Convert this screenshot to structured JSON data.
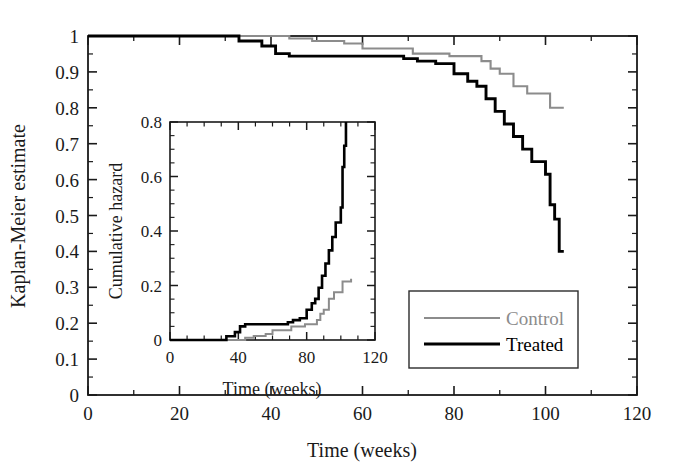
{
  "figure": {
    "background": "#ffffff",
    "colors": {
      "control": "#8c8c8c",
      "treated": "#000000",
      "axis": "#1a1a1a"
    }
  },
  "chart_data": {
    "type": "line",
    "title": "",
    "xlabel": "Time (weeks)",
    "ylabel": "Kaplan-Meier estimate",
    "xlim": [
      0,
      120
    ],
    "ylim": [
      0,
      1
    ],
    "xticks": [
      0,
      20,
      40,
      60,
      80,
      100,
      120
    ],
    "xticklabels": [
      "0",
      "20",
      "40",
      "60",
      "80",
      "100",
      "120"
    ],
    "yticks": [
      0,
      0.1,
      0.2,
      0.3,
      0.4,
      0.5,
      0.6,
      0.7,
      0.8,
      0.9,
      1
    ],
    "yticklabels": [
      "0",
      "0.1",
      "0.2",
      "0.3",
      "0.4",
      "0.5",
      "0.6",
      "0.7",
      "0.8",
      "0.9",
      "1"
    ],
    "xminor_step": 10,
    "yminor_step": 0.05,
    "grid": false,
    "legend_position": "lower right",
    "step_style": "post",
    "series": [
      {
        "name": "Control",
        "color": "#8c8c8c",
        "points": [
          [
            0,
            1.0
          ],
          [
            44,
            1.0
          ],
          [
            44,
            0.993
          ],
          [
            49,
            0.993
          ],
          [
            49,
            0.986
          ],
          [
            56,
            0.986
          ],
          [
            56,
            0.979
          ],
          [
            60,
            0.979
          ],
          [
            60,
            0.965
          ],
          [
            71,
            0.965
          ],
          [
            71,
            0.951
          ],
          [
            79,
            0.951
          ],
          [
            79,
            0.944
          ],
          [
            86,
            0.944
          ],
          [
            86,
            0.93
          ],
          [
            88,
            0.93
          ],
          [
            88,
            0.909
          ],
          [
            90,
            0.909
          ],
          [
            90,
            0.895
          ],
          [
            93,
            0.895
          ],
          [
            93,
            0.86
          ],
          [
            96,
            0.86
          ],
          [
            96,
            0.84
          ],
          [
            101,
            0.84
          ],
          [
            101,
            0.8
          ],
          [
            104,
            0.8
          ]
        ]
      },
      {
        "name": "Treated",
        "color": "#000000",
        "points": [
          [
            0,
            1.0
          ],
          [
            33,
            1.0
          ],
          [
            33,
            0.986
          ],
          [
            38,
            0.986
          ],
          [
            38,
            0.972
          ],
          [
            41,
            0.972
          ],
          [
            41,
            0.951
          ],
          [
            44,
            0.951
          ],
          [
            44,
            0.944
          ],
          [
            69,
            0.944
          ],
          [
            69,
            0.937
          ],
          [
            72,
            0.937
          ],
          [
            72,
            0.93
          ],
          [
            76,
            0.93
          ],
          [
            76,
            0.923
          ],
          [
            80,
            0.923
          ],
          [
            80,
            0.895
          ],
          [
            83,
            0.895
          ],
          [
            83,
            0.874
          ],
          [
            85,
            0.874
          ],
          [
            85,
            0.86
          ],
          [
            87,
            0.86
          ],
          [
            87,
            0.825
          ],
          [
            89,
            0.825
          ],
          [
            89,
            0.79
          ],
          [
            91,
            0.79
          ],
          [
            91,
            0.755
          ],
          [
            93,
            0.755
          ],
          [
            93,
            0.72
          ],
          [
            95,
            0.72
          ],
          [
            95,
            0.685
          ],
          [
            97,
            0.685
          ],
          [
            97,
            0.65
          ],
          [
            100,
            0.65
          ],
          [
            100,
            0.615
          ],
          [
            101,
            0.615
          ],
          [
            101,
            0.53
          ],
          [
            102,
            0.53
          ],
          [
            102,
            0.49
          ],
          [
            103,
            0.49
          ],
          [
            103,
            0.4
          ],
          [
            104,
            0.4
          ]
        ]
      }
    ]
  },
  "inset_chart_data": {
    "type": "line",
    "title": "",
    "xlabel": "Time (weeks)",
    "ylabel": "Cumulative hazard",
    "xlim": [
      0,
      120
    ],
    "ylim": [
      0,
      0.8
    ],
    "xticks": [
      0,
      40,
      80,
      120
    ],
    "xticklabels": [
      "0",
      "40",
      "80",
      "120"
    ],
    "yticks": [
      0,
      0.2,
      0.4,
      0.6,
      0.8
    ],
    "yticklabels": [
      "0",
      "0.2",
      "0.4",
      "0.6",
      "0.8"
    ],
    "xminor_step": 10,
    "yminor_step": 0.05,
    "grid": false,
    "legend_position": "none",
    "step_style": "post",
    "series": [
      {
        "name": "Control",
        "color": "#8c8c8c",
        "points": [
          [
            0,
            0.0
          ],
          [
            44,
            0.0
          ],
          [
            44,
            0.008
          ],
          [
            49,
            0.008
          ],
          [
            49,
            0.015
          ],
          [
            56,
            0.015
          ],
          [
            56,
            0.022
          ],
          [
            60,
            0.022
          ],
          [
            60,
            0.036
          ],
          [
            71,
            0.036
          ],
          [
            71,
            0.05
          ],
          [
            79,
            0.05
          ],
          [
            79,
            0.058
          ],
          [
            86,
            0.058
          ],
          [
            86,
            0.073
          ],
          [
            88,
            0.073
          ],
          [
            88,
            0.096
          ],
          [
            90,
            0.096
          ],
          [
            90,
            0.111
          ],
          [
            93,
            0.111
          ],
          [
            93,
            0.151
          ],
          [
            96,
            0.151
          ],
          [
            96,
            0.175
          ],
          [
            101,
            0.175
          ],
          [
            101,
            0.215
          ],
          [
            106,
            0.215
          ],
          [
            106,
            0.225
          ]
        ]
      },
      {
        "name": "Treated",
        "color": "#000000",
        "points": [
          [
            0,
            0.0
          ],
          [
            33,
            0.0
          ],
          [
            33,
            0.014
          ],
          [
            38,
            0.014
          ],
          [
            38,
            0.029
          ],
          [
            41,
            0.029
          ],
          [
            41,
            0.05
          ],
          [
            44,
            0.05
          ],
          [
            44,
            0.058
          ],
          [
            69,
            0.058
          ],
          [
            69,
            0.065
          ],
          [
            72,
            0.065
          ],
          [
            72,
            0.073
          ],
          [
            76,
            0.073
          ],
          [
            76,
            0.08
          ],
          [
            80,
            0.08
          ],
          [
            80,
            0.111
          ],
          [
            83,
            0.111
          ],
          [
            83,
            0.135
          ],
          [
            85,
            0.135
          ],
          [
            85,
            0.151
          ],
          [
            87,
            0.151
          ],
          [
            87,
            0.192
          ],
          [
            89,
            0.192
          ],
          [
            89,
            0.236
          ],
          [
            91,
            0.236
          ],
          [
            91,
            0.281
          ],
          [
            93,
            0.281
          ],
          [
            93,
            0.329
          ],
          [
            95,
            0.329
          ],
          [
            95,
            0.378
          ],
          [
            97,
            0.378
          ],
          [
            97,
            0.431
          ],
          [
            100,
            0.431
          ],
          [
            100,
            0.486
          ],
          [
            101,
            0.486
          ],
          [
            101,
            0.635
          ],
          [
            102,
            0.635
          ],
          [
            102,
            0.713
          ],
          [
            103,
            0.713
          ],
          [
            103,
            0.8
          ]
        ]
      }
    ]
  },
  "legend": {
    "items": [
      {
        "label": "Control",
        "color": "#8c8c8c",
        "width": 2
      },
      {
        "label": "Treated",
        "color": "#000000",
        "width": 3
      }
    ]
  }
}
